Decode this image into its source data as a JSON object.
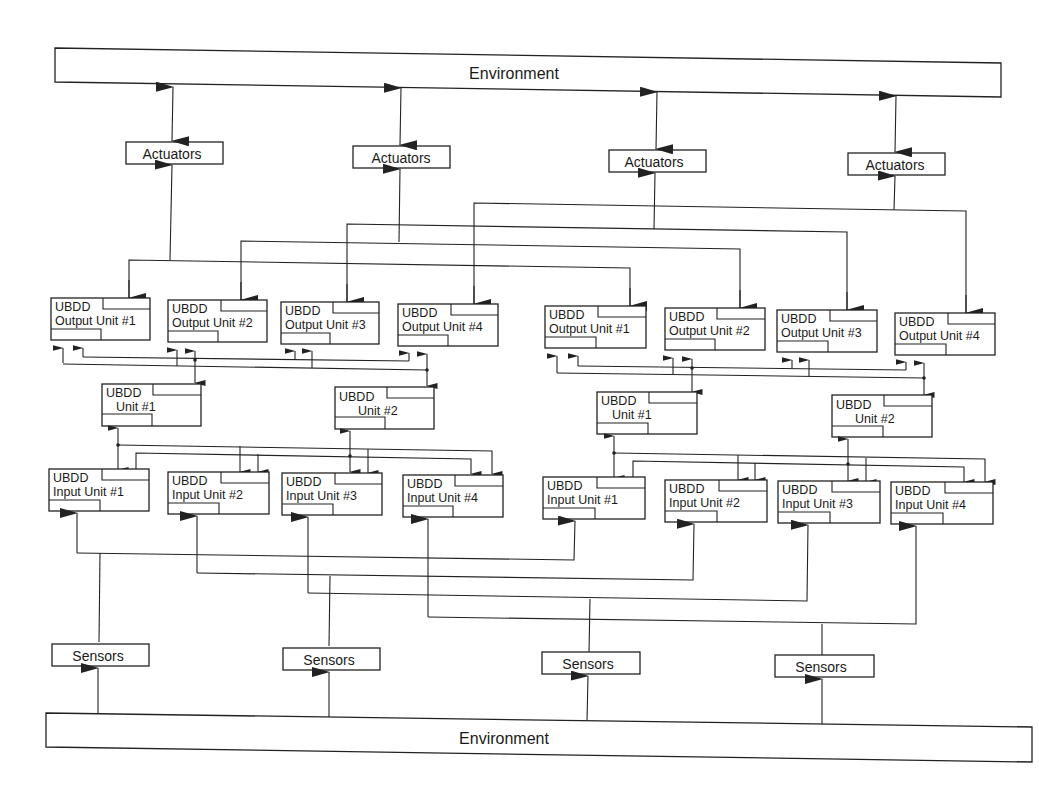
{
  "diagram": {
    "type": "block-diagram",
    "colors": {
      "stroke": "#222222",
      "background": "#ffffff",
      "text": "#1a1a1a"
    },
    "environment_top": {
      "label": "Environment"
    },
    "environment_bottom": {
      "label": "Environment"
    },
    "actuators": [
      {
        "label": "Actuators"
      },
      {
        "label": "Actuators"
      },
      {
        "label": "Actuators"
      },
      {
        "label": "Actuators"
      }
    ],
    "sensors": [
      {
        "label": "Sensors"
      },
      {
        "label": "Sensors"
      },
      {
        "label": "Sensors"
      },
      {
        "label": "Sensors"
      }
    ],
    "left_group": {
      "output_units": [
        {
          "line1": "UBDD",
          "line2": "Output Unit #1"
        },
        {
          "line1": "UBDD",
          "line2": "Output Unit #2"
        },
        {
          "line1": "UBDD",
          "line2": "Output Unit #3"
        },
        {
          "line1": "UBDD",
          "line2": "Output Unit #4"
        }
      ],
      "units": [
        {
          "line1": "UBDD",
          "line2": "Unit #1"
        },
        {
          "line1": "UBDD",
          "line2": "Unit #2"
        }
      ],
      "input_units": [
        {
          "line1": "UBDD",
          "line2": "Input Unit #1"
        },
        {
          "line1": "UBDD",
          "line2": "Input Unit #2"
        },
        {
          "line1": "UBDD",
          "line2": "Input Unit #3"
        },
        {
          "line1": "UBDD",
          "line2": "Input Unit #4"
        }
      ]
    },
    "right_group": {
      "output_units": [
        {
          "line1": "UBDD",
          "line2": "Output Unit #1"
        },
        {
          "line1": "UBDD",
          "line2": "Output Unit #2"
        },
        {
          "line1": "UBDD",
          "line2": "Output Unit #3"
        },
        {
          "line1": "UBDD",
          "line2": "Output Unit #4"
        }
      ],
      "units": [
        {
          "line1": "UBDD",
          "line2": "Unit #1"
        },
        {
          "line1": "UBDD",
          "line2": "Unit #2"
        }
      ],
      "input_units": [
        {
          "line1": "UBDD",
          "line2": "Input Unit #1"
        },
        {
          "line1": "UBDD",
          "line2": "Input Unit #2"
        },
        {
          "line1": "UBDD",
          "line2": "Input Unit #3"
        },
        {
          "line1": "UBDD",
          "line2": "Input Unit #4"
        }
      ]
    }
  }
}
